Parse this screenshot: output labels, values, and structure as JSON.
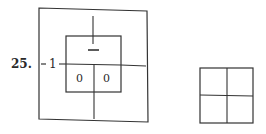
{
  "problem": {
    "number": "25."
  },
  "diagram": {
    "outer_label": "1",
    "top_sign": "–",
    "left_cell": "0",
    "right_cell": "0"
  }
}
